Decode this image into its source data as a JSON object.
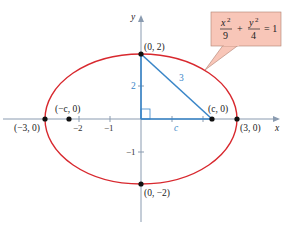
{
  "diagram": {
    "equation": {
      "x_num": "x",
      "x_den": "9",
      "y_num": "y",
      "y_den": "4",
      "plus": "+",
      "equals": "= 1",
      "exp": "2"
    },
    "axes": {
      "x_label": "x",
      "y_label": "y"
    },
    "points": {
      "top": "(0, 2)",
      "bottom": "(0, −2)",
      "left_vertex": "(−3, 0)",
      "right_vertex": "(3, 0)",
      "left_focus": "(−c, 0)",
      "right_focus": "(c, 0)"
    },
    "x_ticks": [
      "−2",
      "−1"
    ],
    "y_ticks": [
      "2",
      "−1"
    ],
    "triangle_labels": {
      "hypotenuse": "3",
      "base": "c",
      "height": "2"
    },
    "colors": {
      "ellipse": "#d8282e",
      "triangle": "#3a86c8",
      "axis": "#8a9bb0",
      "callout_fill": "#f8c6b8"
    }
  }
}
